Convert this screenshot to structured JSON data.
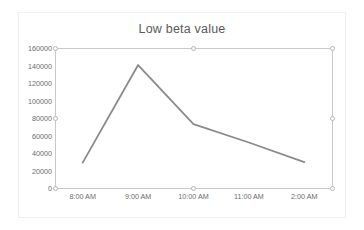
{
  "chart_data": {
    "type": "line",
    "title": "Low beta value",
    "xlabel": "",
    "ylabel": "",
    "categories": [
      "8:00 AM",
      "9:00 AM",
      "10:00 AM",
      "11:00 AM",
      "2:00 AM"
    ],
    "values": [
      29000,
      140500,
      73000,
      52000,
      29500
    ],
    "series": [
      {
        "name": "Low beta value",
        "values": [
          29000,
          140500,
          73000,
          52000,
          29500
        ],
        "color": "#8a8a8a"
      }
    ],
    "ylim": [
      0,
      160000
    ],
    "yticks": [
      0,
      20000,
      40000,
      60000,
      80000,
      100000,
      120000,
      140000,
      160000
    ],
    "ytick_labels": [
      "0",
      "20000",
      "40000",
      "60000",
      "80000",
      "100000",
      "120000",
      "140000",
      "160000"
    ],
    "grid": false,
    "legend": "none"
  },
  "colors": {
    "line": "#8a8a8a",
    "axis": "#c8c8c8",
    "tick_text": "#6b6b6b",
    "title_text": "#595959",
    "frame": "#efefef",
    "handle_fill": "#ffffff",
    "handle_stroke": "#b4b4b4"
  },
  "selection": {
    "handles": [
      {
        "name": "handle-top-left",
        "x": 55,
        "y": 48
      },
      {
        "name": "handle-top-center",
        "x": 193,
        "y": 48
      },
      {
        "name": "handle-top-right",
        "x": 332,
        "y": 48
      },
      {
        "name": "handle-middle-left",
        "x": 55,
        "y": 118
      },
      {
        "name": "handle-middle-right",
        "x": 332,
        "y": 118
      },
      {
        "name": "handle-bottom-left",
        "x": 55,
        "y": 188
      },
      {
        "name": "handle-bottom-center",
        "x": 193,
        "y": 188
      },
      {
        "name": "handle-bottom-right",
        "x": 332,
        "y": 188
      }
    ]
  }
}
